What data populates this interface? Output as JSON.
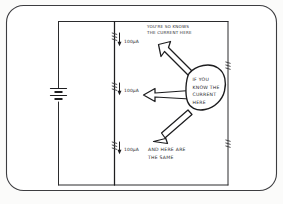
{
  "figure": {
    "type": "hand-drawn-circuit-diagram",
    "ink_color": "#1d1d1f",
    "paper_color": "#ffffff",
    "frame_color": "#3d3d40"
  },
  "circuit": {
    "source": {
      "name": "battery-cell",
      "position": "left-branch",
      "label": ""
    },
    "branches": [
      {
        "id": "middle-wire",
        "name": "middle-branch",
        "current_direction": "down"
      },
      {
        "id": "right-wire",
        "name": "right-branch",
        "components": "two-resistors"
      }
    ],
    "current_markers": [
      {
        "value": "100μA",
        "position": "top"
      },
      {
        "value": "100μA",
        "position": "middle"
      },
      {
        "value": "100μA",
        "position": "bottom"
      }
    ]
  },
  "annotations": {
    "top_note_line1": "YOU'RE SO KNOWS",
    "top_note_line2": "THE CURRENT HERE",
    "balloon": {
      "line1": "IF YOU",
      "line2": "KNOW THE",
      "line3": "CURRENT",
      "line4": "HERE"
    },
    "bottom_note_line1": "AND HERE ARE",
    "bottom_note_line2": "THE SAME"
  }
}
